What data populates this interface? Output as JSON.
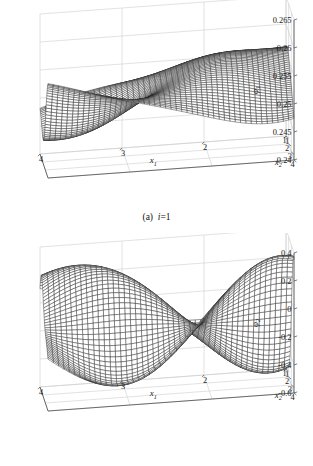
{
  "figure": {
    "type": "multi-panel-3d-surface",
    "background": "#ffffff",
    "mesh_color": "#1c1c1c",
    "grid_color": "#c9c9c9",
    "axis_color": "#4a4a4a"
  },
  "panels": [
    {
      "id": "a",
      "caption_prefix": "(a)",
      "caption_var": "i",
      "caption_value": "=1",
      "zlabel": "φ",
      "zlabel_sub": "1",
      "xlabel": "x",
      "xlabel_sub": "1",
      "ylabel": "x",
      "ylabel_sub": "2",
      "zticks": [
        "0.24",
        "0.245",
        "0.25",
        "0.255",
        "0.26",
        "0.265"
      ],
      "xticks": [
        "1",
        "2",
        "3",
        "4"
      ],
      "yticks": [
        "1",
        "2",
        "3",
        "4"
      ],
      "corner_tick": "4"
    },
    {
      "id": "b",
      "caption_prefix": "(b)",
      "caption_var": "i",
      "caption_value": "=2",
      "zlabel": "φ",
      "zlabel_sub": "2",
      "xlabel": "x",
      "xlabel_sub": "1",
      "ylabel": "x",
      "ylabel_sub": "2",
      "zticks": [
        "-0.6",
        "-0.4",
        "-0.2",
        "0",
        "0.2",
        "0.4"
      ],
      "xticks": [
        "1",
        "2",
        "3",
        "4"
      ],
      "yticks": [
        "1",
        "2",
        "3",
        "4"
      ],
      "corner_tick": "4"
    }
  ],
  "chart_data": [
    {
      "type": "surface",
      "panel": "a",
      "title": "(a) i=1",
      "xlabel": "x1",
      "ylabel": "x2",
      "zlabel": "phi_1",
      "xlim": [
        1,
        4
      ],
      "ylim": [
        1,
        4
      ],
      "zlim": [
        0.24,
        0.265
      ],
      "zticks": [
        0.24,
        0.245,
        0.25,
        0.255,
        0.26,
        0.265
      ],
      "xticks": [
        1,
        2,
        3,
        4
      ],
      "yticks": [
        1,
        2,
        3,
        4
      ],
      "grid": true,
      "legend": "none",
      "mesh_n": 46,
      "surface_model": {
        "base": 0.2515,
        "amp": 0.0098,
        "terms": [
          {
            "a": 0.52,
            "fx": 1.05,
            "px": 0.55,
            "fy": 0.85,
            "py": 0.25
          },
          {
            "a": 0.3,
            "fx": 1.85,
            "px": -0.4,
            "fy": 1.35,
            "py": 0.95
          },
          {
            "a": 0.18,
            "fx": 0.7,
            "px": 1.3,
            "fy": 2.1,
            "py": -0.3
          },
          {
            "a": 0.12,
            "fx": 2.6,
            "px": 0.15,
            "fy": 0.55,
            "py": 1.6
          }
        ],
        "tilt_x": -0.28,
        "tilt_y": 0.34
      }
    },
    {
      "type": "surface",
      "panel": "b",
      "title": "(b) i=2",
      "xlabel": "x1",
      "ylabel": "x2",
      "zlabel": "phi_2",
      "xlim": [
        1,
        4
      ],
      "ylim": [
        1,
        4
      ],
      "zlim": [
        -0.6,
        0.4
      ],
      "zticks": [
        -0.6,
        -0.4,
        -0.2,
        0,
        0.2,
        0.4
      ],
      "xticks": [
        1,
        2,
        3,
        4
      ],
      "yticks": [
        1,
        2,
        3,
        4
      ],
      "grid": true,
      "legend": "none",
      "mesh_n": 46,
      "surface_model": {
        "base": -0.07,
        "amp": 0.4,
        "terms": [
          {
            "a": 0.85,
            "fx": 1.55,
            "px": -0.6,
            "fy": 1.45,
            "py": -0.35
          },
          {
            "a": 0.42,
            "fx": 0.85,
            "px": 0.9,
            "fy": 0.95,
            "py": 1.25
          },
          {
            "a": 0.22,
            "fx": 2.4,
            "px": 0.3,
            "fy": 1.9,
            "py": 0.1
          }
        ],
        "tilt_x": 0.1,
        "tilt_y": 0.12
      }
    }
  ]
}
